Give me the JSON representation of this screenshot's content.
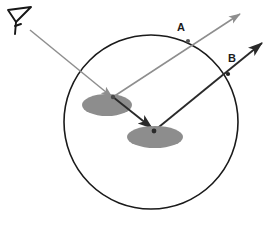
{
  "figure": {
    "background_color": "#ffffff"
  },
  "boundary": {
    "name": "medium-boundary-circle",
    "shape": "circle",
    "cx": 151,
    "cy": 122,
    "r": 87,
    "stroke_color": "#1a1a1a",
    "stroke_width": 1.6,
    "fill": "none"
  },
  "observer": {
    "name": "observer-eye",
    "label": "",
    "x": 18,
    "y": 18,
    "stroke_color": "#161616"
  },
  "scatterers": [
    {
      "name": "scatterer-disk-1",
      "cx": 107,
      "cy": 105,
      "rx": 25,
      "ry": 11,
      "fill_color": "#8d8d8d"
    },
    {
      "name": "scatterer-disk-2",
      "cx": 155,
      "cy": 137,
      "rx": 28,
      "ry": 11,
      "fill_color": "#8d8d8d"
    }
  ],
  "rays": [
    {
      "name": "incident-ray-from-observer",
      "color": "#8e8e8e",
      "from": [
        30,
        30
      ],
      "to": [
        112,
        97
      ],
      "arrowhead": true,
      "label": ""
    },
    {
      "name": "scattered-ray-disk1-to-disk2",
      "color": "#2a2a2a",
      "from": [
        113,
        97
      ],
      "to": [
        154,
        130
      ],
      "arrowhead": true,
      "label": ""
    },
    {
      "name": "exit-ray-a",
      "color": "#8e8e8e",
      "from": [
        113,
        97
      ],
      "to": [
        240,
        14
      ],
      "arrowhead": true,
      "label": "A",
      "label_x": 181,
      "label_y": 31,
      "boundary_crossing": [
        188,
        41
      ]
    },
    {
      "name": "exit-ray-b",
      "color": "#2a2a2a",
      "from": [
        154,
        131
      ],
      "to": [
        262,
        43
      ],
      "arrowhead": true,
      "label": "B",
      "label_x": 232,
      "label_y": 62,
      "boundary_crossing": [
        228,
        74
      ]
    }
  ],
  "labels": {
    "ray_a": "A",
    "ray_b": "B"
  },
  "crossing_markers": [
    {
      "name": "crossing-marker-a",
      "cx": 188,
      "cy": 41,
      "r": 2.1,
      "fill": "#555555"
    },
    {
      "name": "crossing-marker-b",
      "cx": 228,
      "cy": 74,
      "r": 2.1,
      "fill": "#222222"
    },
    {
      "name": "scatter-point-1",
      "cx": 113,
      "cy": 97,
      "r": 2.2,
      "fill": "#4a4a4a"
    },
    {
      "name": "scatter-point-2",
      "cx": 154,
      "cy": 131,
      "r": 2.4,
      "fill": "#2a2a2a"
    }
  ]
}
